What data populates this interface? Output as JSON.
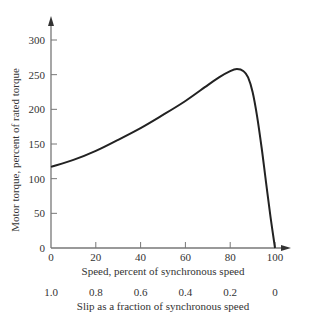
{
  "chart_data": {
    "type": "line",
    "title": "",
    "xlabel": "Speed, percent of synchronous speed",
    "ylabel": "Motor torque, percent of rated torque",
    "secondary_xlabel": "Slip as a fraction of synchronous speed",
    "xlim": [
      0,
      100
    ],
    "ylim": [
      0,
      300
    ],
    "x_ticks": [
      0,
      20,
      40,
      60,
      80,
      100
    ],
    "y_ticks": [
      0,
      50,
      100,
      150,
      200,
      250,
      300
    ],
    "secondary_x_ticks": [
      "1.0",
      "0.8",
      "0.6",
      "0.4",
      "0.2",
      "0"
    ],
    "grid": false,
    "legend": null,
    "series": [
      {
        "name": "Torque-speed curve",
        "x": [
          0,
          10,
          20,
          30,
          40,
          50,
          60,
          70,
          75,
          80,
          83,
          86,
          88,
          90,
          92,
          94,
          96,
          98,
          100
        ],
        "y": [
          117,
          127,
          140,
          156,
          173,
          192,
          212,
          235,
          246,
          255,
          258,
          255,
          246,
          225,
          190,
          145,
          95,
          45,
          0
        ]
      }
    ]
  },
  "axes": {
    "x_tick_labels": [
      "0",
      "20",
      "40",
      "60",
      "80",
      "100"
    ],
    "y_tick_labels": [
      "0",
      "50",
      "100",
      "150",
      "200",
      "250",
      "300"
    ],
    "slip_tick_labels": [
      "1.0",
      "0.8",
      "0.6",
      "0.4",
      "0.2",
      "0"
    ]
  },
  "colors": {
    "axis": "#777777",
    "curve": "#222222",
    "text": "#333333"
  }
}
